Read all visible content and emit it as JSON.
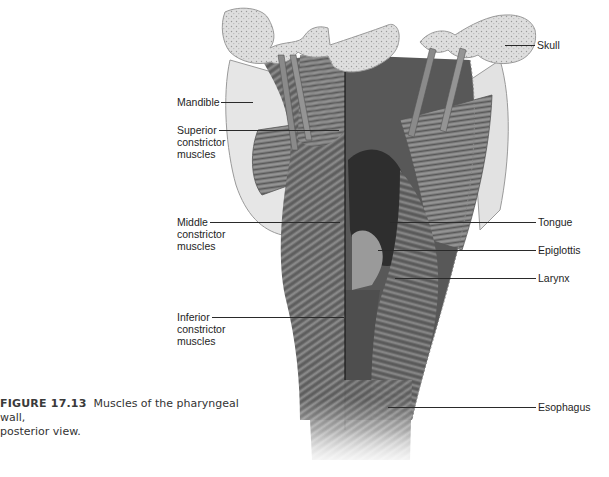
{
  "figure": {
    "number": "FIGURE 17.13",
    "caption_text": "Muscles of the pharyngeal wall, posterior view.",
    "caption_line1": "Muscles of the pharyngeal wall,",
    "caption_line2": "posterior view.",
    "illustration": "Posterior view of pharyngeal wall muscles (grayscale anatomical drawing)",
    "colors": {
      "muscle_dark": "#4a4a4a",
      "muscle_mid": "#7a7a7a",
      "bone": "#d8d8d8",
      "cavity": "#2c2c2c",
      "leader_line": "#2a2a2a"
    }
  },
  "labels": {
    "left": [
      {
        "id": "mandible",
        "text": "Mandible"
      },
      {
        "id": "superior",
        "text": "Superior\nconstrictor\nmuscles"
      },
      {
        "id": "middle",
        "text": "Middle\nconstrictor\nmuscles"
      },
      {
        "id": "inferior",
        "text": "Inferior\nconstrictor\nmuscles"
      }
    ],
    "right": [
      {
        "id": "skull",
        "text": "Skull"
      },
      {
        "id": "tongue",
        "text": "Tongue"
      },
      {
        "id": "epiglottis",
        "text": "Epiglottis"
      },
      {
        "id": "larynx",
        "text": "Larynx"
      },
      {
        "id": "esophagus",
        "text": "Esophagus"
      }
    ]
  }
}
